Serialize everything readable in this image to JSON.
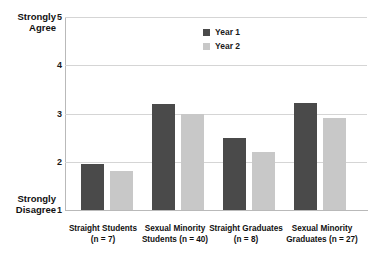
{
  "chart_data": {
    "type": "bar",
    "title": "",
    "xlabel": "",
    "ylabel": "",
    "ylim": [
      1,
      5
    ],
    "yticks": [
      1,
      2,
      3,
      4,
      5
    ],
    "ytick_labels": [
      "1",
      "2",
      "3",
      "4",
      "5"
    ],
    "y_axis_caption_top": "Strongly Agree",
    "y_axis_caption_top_line1": "Strongly",
    "y_axis_caption_top_line2": "Agree",
    "y_axis_caption_bottom": "Strongly Disagree",
    "y_axis_caption_bottom_line1": "Strongly",
    "y_axis_caption_bottom_line2": "Disagree",
    "grid": true,
    "legend_position": "top-center",
    "categories": [
      "Straight Students (n = 7)",
      "Sexual Minority Students (n = 40)",
      "Straight Graduates (n = 8)",
      "Sexual Minority Graduates (n = 27)"
    ],
    "category_lines": [
      {
        "line1": "Straight Students",
        "line2": "(n = 7)"
      },
      {
        "line1": "Sexual Minority",
        "line2": "Students (n = 40)"
      },
      {
        "line1": "Straight Graduates",
        "line2": "(n = 8)"
      },
      {
        "line1": "Sexual Minority",
        "line2": "Graduates (n = 27)"
      }
    ],
    "series": [
      {
        "name": "Year 1",
        "color": "#4a4a4a",
        "values": [
          1.95,
          3.2,
          2.5,
          3.22
        ]
      },
      {
        "name": "Year 2",
        "color": "#c8c8c8",
        "values": [
          1.8,
          3.0,
          2.2,
          2.9
        ]
      }
    ]
  }
}
